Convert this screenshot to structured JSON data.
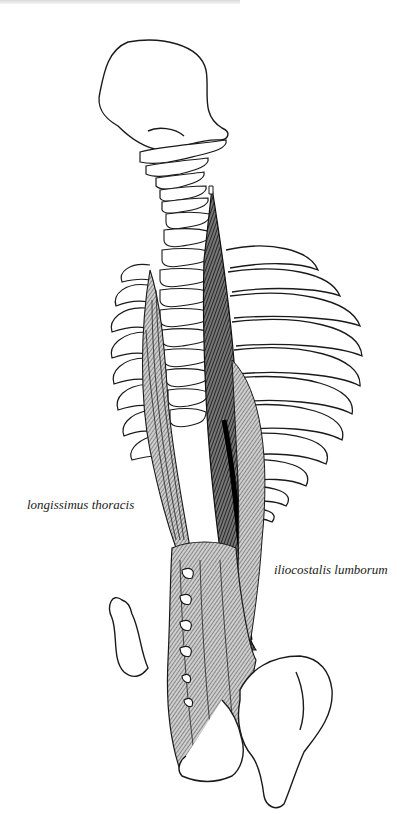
{
  "figure": {
    "colors": {
      "outline": "#1a1a1a",
      "muscle_fill": "#8c8c8c",
      "muscle_dark": "#111111",
      "bone_fill": "#ffffff"
    }
  },
  "labels": {
    "left": "longissimus thoracis",
    "right": "iliocostalis lumborum"
  }
}
